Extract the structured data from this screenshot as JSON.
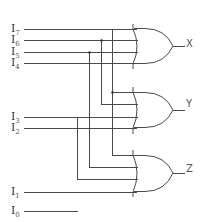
{
  "diagram": {
    "type": "8-to-3 encoder (OR gate implementation)",
    "inputs": [
      {
        "name": "I",
        "sub": "7",
        "y": 29,
        "end_x": 136
      },
      {
        "name": "I",
        "sub": "6",
        "y": 40,
        "end_x": 136
      },
      {
        "name": "I",
        "sub": "5",
        "y": 52,
        "end_x": 136
      },
      {
        "name": "I",
        "sub": "4",
        "y": 63,
        "end_x": 136
      },
      {
        "name": "I",
        "sub": "3",
        "y": 117,
        "end_x": 136
      },
      {
        "name": "I",
        "sub": "2",
        "y": 128,
        "end_x": 136
      },
      {
        "name": "I",
        "sub": "1",
        "y": 192,
        "end_x": 136
      },
      {
        "name": "I",
        "sub": "0",
        "y": 211,
        "end_x": 78
      }
    ],
    "gates": [
      {
        "type": "OR",
        "output": "X",
        "inputs": [
          "I7",
          "I6",
          "I5",
          "I4"
        ]
      },
      {
        "type": "OR",
        "output": "Y",
        "inputs": [
          "I7",
          "I6",
          "I3",
          "I2"
        ]
      },
      {
        "type": "OR",
        "output": "Z",
        "inputs": [
          "I7",
          "I5",
          "I3",
          "I1"
        ]
      }
    ],
    "outputs": {
      "x": "X",
      "y": "Y",
      "z": "Z"
    }
  }
}
